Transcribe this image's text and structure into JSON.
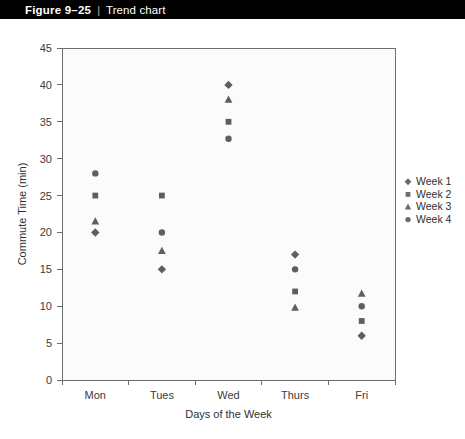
{
  "header": {
    "figure_number": "Figure 9–25",
    "separator": "|",
    "title": "Trend chart"
  },
  "chart_data": {
    "type": "scatter",
    "title": "Trend chart",
    "xlabel": "Days of the Week",
    "ylabel": "Commute Time (min)",
    "categories": [
      "Mon",
      "Tues",
      "Wed",
      "Thurs",
      "Fri"
    ],
    "ylim": [
      0,
      45
    ],
    "yticks": [
      0,
      5,
      10,
      15,
      20,
      25,
      30,
      35,
      40,
      45
    ],
    "ytick_labels": [
      "0",
      "5",
      "10",
      "15",
      "20",
      "25",
      "30",
      "35",
      "40",
      "45"
    ],
    "grid": false,
    "legend_position": "right",
    "series": [
      {
        "name": "Week 1",
        "marker": "diamond",
        "color": "#5e5e5e",
        "values": [
          20,
          15,
          40,
          17,
          6
        ]
      },
      {
        "name": "Week 2",
        "marker": "square",
        "color": "#5e5e5e",
        "values": [
          25,
          25,
          35,
          12,
          8
        ]
      },
      {
        "name": "Week 3",
        "marker": "triangle",
        "color": "#5e5e5e",
        "values": [
          21.5,
          17.5,
          38,
          9.8,
          11.7
        ]
      },
      {
        "name": "Week 4",
        "marker": "circle",
        "color": "#5e5e5e",
        "values": [
          28,
          20,
          32.7,
          15,
          10
        ]
      }
    ]
  },
  "legend": {
    "items": [
      {
        "label": "Week 1",
        "marker": "diamond"
      },
      {
        "label": "Week 2",
        "marker": "square"
      },
      {
        "label": "Week 3",
        "marker": "triangle"
      },
      {
        "label": "Week 4",
        "marker": "circle"
      }
    ]
  }
}
